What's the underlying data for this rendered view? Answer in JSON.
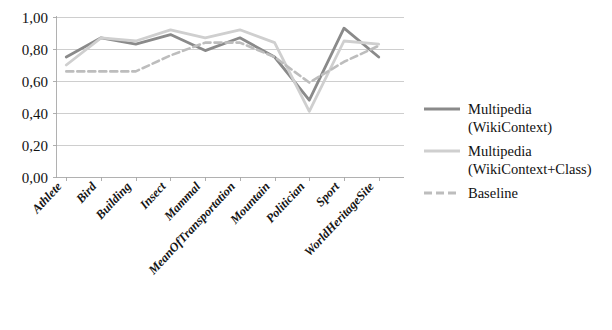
{
  "chart_data": {
    "type": "line",
    "title": "",
    "xlabel": "",
    "ylabel": "",
    "ylim": [
      0.0,
      1.0
    ],
    "ytick_labels": [
      "0,00",
      "0,20",
      "0,40",
      "0,60",
      "0,80",
      "1,00"
    ],
    "ytick_values": [
      0.0,
      0.2,
      0.4,
      0.6,
      0.8,
      1.0
    ],
    "grid": true,
    "legend_position": "right",
    "categories": [
      "Athlete",
      "Bird",
      "Building",
      "Insect",
      "Mammal",
      "MeanOfTransportation",
      "Mountain",
      "Politician",
      "Sport",
      "WorldHeritageSite"
    ],
    "series": [
      {
        "name": "Multipedia (WikiContext)",
        "color": "#8a8a8a",
        "style": "solid",
        "values": [
          0.75,
          0.87,
          0.83,
          0.89,
          0.79,
          0.87,
          0.75,
          0.48,
          0.93,
          0.75
        ]
      },
      {
        "name": "Multipedia (WikiContext+Class)",
        "color": "#cfcfcf",
        "style": "solid",
        "values": [
          0.7,
          0.87,
          0.85,
          0.92,
          0.87,
          0.92,
          0.84,
          0.41,
          0.85,
          0.83
        ]
      },
      {
        "name": "Baseline",
        "color": "#bdbdbd",
        "style": "dashed",
        "values": [
          0.66,
          0.66,
          0.66,
          0.76,
          0.84,
          0.84,
          0.75,
          0.59,
          0.72,
          0.82
        ]
      }
    ]
  },
  "legend": {
    "entries": [
      {
        "label_line1": "Multipedia",
        "label_line2": "(WikiContext)"
      },
      {
        "label_line1": "Multipedia",
        "label_line2": "(WikiContext+Class)"
      },
      {
        "label_line1": "Baseline",
        "label_line2": ""
      }
    ]
  }
}
